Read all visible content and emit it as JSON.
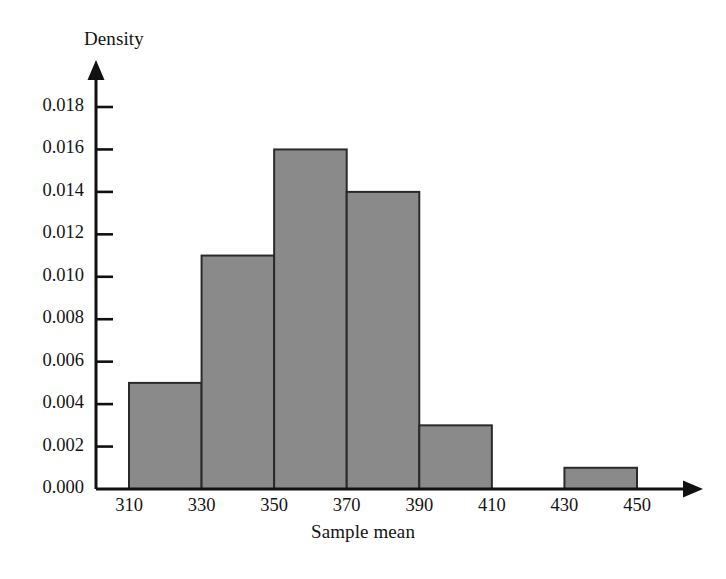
{
  "chart_data": {
    "type": "bar",
    "title": "",
    "subtitle": "",
    "xlabel": "Sample mean",
    "ylabel": "Density",
    "grid": false,
    "legend": false,
    "legend_position": "none",
    "bin_width": 20,
    "bin_edges": [
      310,
      330,
      350,
      370,
      390,
      410,
      430,
      450
    ],
    "categories": [
      "310-330",
      "330-350",
      "350-370",
      "370-390",
      "390-410",
      "410-430",
      "430-450"
    ],
    "values": [
      0.005,
      0.011,
      0.016,
      0.014,
      0.003,
      0.0,
      0.001
    ],
    "bars": [
      {
        "x0": 310,
        "x1": 330,
        "height": 0.005
      },
      {
        "x0": 330,
        "x1": 350,
        "height": 0.011
      },
      {
        "x0": 350,
        "x1": 370,
        "height": 0.016
      },
      {
        "x0": 370,
        "x1": 390,
        "height": 0.014
      },
      {
        "x0": 390,
        "x1": 410,
        "height": 0.003
      },
      {
        "x0": 410,
        "x1": 430,
        "height": 0.0
      },
      {
        "x0": 430,
        "x1": 450,
        "height": 0.001
      }
    ],
    "xlim": [
      310,
      450
    ],
    "ylim": [
      0.0,
      0.018
    ],
    "xticks": [
      310,
      330,
      350,
      370,
      390,
      410,
      430,
      450
    ],
    "xtick_labels": [
      "310",
      "330",
      "350",
      "370",
      "390",
      "410",
      "430",
      "450"
    ],
    "yticks": [
      0.0,
      0.002,
      0.004,
      0.006,
      0.008,
      0.01,
      0.012,
      0.014,
      0.016,
      0.018
    ],
    "ytick_labels": [
      "0.000",
      "0.002",
      "0.004",
      "0.006",
      "0.008",
      "0.010",
      "0.012",
      "0.014",
      "0.016",
      "0.018"
    ],
    "colors": {
      "bar_fill": "#8a8a8a",
      "bar_stroke": "#2a2a2a",
      "axis": "#111111",
      "text": "#141414",
      "background": "#ffffff"
    }
  }
}
